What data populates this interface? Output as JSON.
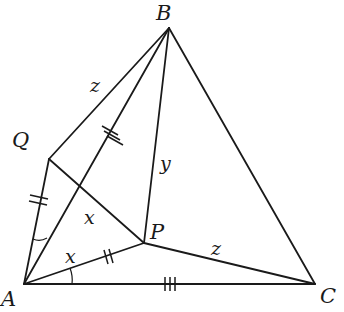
{
  "diagram": {
    "points": {
      "A": {
        "label": "A",
        "x": 24,
        "y": 284
      },
      "B": {
        "label": "B",
        "x": 169,
        "y": 28
      },
      "C": {
        "label": "C",
        "x": 315,
        "y": 284
      },
      "P": {
        "label": "P",
        "x": 144,
        "y": 243
      },
      "Q": {
        "label": "Q",
        "x": 49,
        "y": 159
      }
    },
    "segments": [
      "AB",
      "BC",
      "CA",
      "AP",
      "BP",
      "CP",
      "AQ",
      "QB",
      "QP"
    ],
    "segment_labels": {
      "QB": "z",
      "BP": "y",
      "PC": "z"
    },
    "angle_labels": {
      "QAP_region": "x",
      "PAC": "x"
    },
    "tick_marks": {
      "AB": 3,
      "AC": 3,
      "AQ": 2,
      "AP": 2
    }
  }
}
